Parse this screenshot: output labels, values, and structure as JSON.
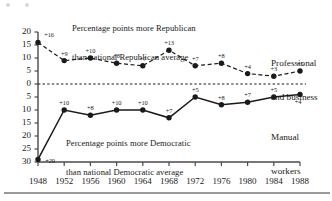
{
  "figure": {
    "annotation_top": [
      "Percentage points more Republican",
      "than national Republican average"
    ],
    "annotation_bottom": [
      "Percentage points more Democratic",
      "than national Democratic average"
    ],
    "series_label_upper": [
      "Professional",
      "and business"
    ],
    "series_label_lower": [
      "Manual",
      "workers"
    ]
  },
  "chart_data": {
    "type": "line",
    "title": "Percentage points more Republican than national Republican average",
    "subtitle": "Percentage points more Democratic than national Democratic average",
    "xlabel": "",
    "ylabel": "",
    "x": [
      1948,
      1952,
      1956,
      1960,
      1964,
      1968,
      1972,
      1976,
      1980,
      1984,
      1988
    ],
    "xtick_labels": [
      "1948",
      "1952",
      "1956",
      "1960",
      "1964",
      "1968",
      "1972",
      "1976",
      "1980",
      "1984",
      "1988"
    ],
    "ytick_labels": [
      "20",
      "15",
      "10",
      "5",
      "0",
      "5",
      "10",
      "15",
      "20",
      "25",
      "30"
    ],
    "ytick_values": [
      20,
      15,
      10,
      5,
      0,
      -5,
      -10,
      -15,
      -20,
      -25,
      -30
    ],
    "ylim": [
      -30,
      20
    ],
    "grid": false,
    "legend_position": "right-inline",
    "zero_line": true,
    "series": [
      {
        "name": "Professional and business",
        "style": "dashed",
        "direction": "Republican",
        "values": [
          16,
          9,
          10,
          8,
          7,
          13,
          7,
          8,
          4,
          3,
          5
        ],
        "data_labels": [
          "+16",
          "+9",
          "+10",
          "+8",
          "+7",
          "+13",
          "+7",
          "+8",
          "+4",
          "+3",
          "+5"
        ]
      },
      {
        "name": "Manual workers",
        "style": "solid",
        "direction": "Democratic",
        "values": [
          -29,
          -10,
          -12,
          -10,
          -10,
          -13,
          -5,
          -8,
          -7,
          -5,
          -4
        ],
        "data_labels": [
          "+29",
          "+10",
          "+8",
          "+10",
          "+10",
          "+7",
          "+5",
          "+8",
          "+7",
          "+5",
          "+4"
        ]
      }
    ],
    "colors": {
      "ink": "#1a1a1a",
      "axis": "#4a4a4a"
    }
  }
}
